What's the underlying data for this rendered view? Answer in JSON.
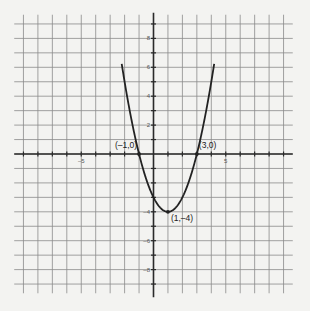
{
  "chart_data": {
    "type": "line",
    "title": "",
    "xlabel": "",
    "ylabel": "",
    "function": "y = (x - 1)^2 - 4",
    "xlim": [
      -9.5,
      9.5
    ],
    "ylim": [
      -9.5,
      9.5
    ],
    "grid": true,
    "x_tick_labels": [
      {
        "value": -5,
        "label": "-5"
      },
      {
        "value": 5,
        "label": "5"
      }
    ],
    "y_tick_labels": [
      {
        "value": 8,
        "label": "8"
      },
      {
        "value": 6,
        "label": "6"
      },
      {
        "value": 4,
        "label": "4"
      },
      {
        "value": 2,
        "label": "2"
      },
      {
        "value": -4,
        "label": "-4"
      },
      {
        "value": -6,
        "label": "-6"
      },
      {
        "value": -8,
        "label": "-8"
      }
    ],
    "series": [
      {
        "name": "parabola",
        "x": [
          -2.1,
          -2,
          -1.5,
          -1,
          -0.5,
          0,
          0.5,
          1,
          1.5,
          2,
          2.5,
          3,
          3.5,
          4,
          4.1
        ],
        "values": [
          5.61,
          5,
          2.25,
          0,
          -1.75,
          -3,
          -3.75,
          -4,
          -3.75,
          -3,
          -1.75,
          0,
          2.25,
          5,
          5.61
        ]
      }
    ],
    "annotations": [
      {
        "x": -1,
        "y": 0,
        "label": "(–1,0)"
      },
      {
        "x": 3,
        "y": 0,
        "label": "(3,0)"
      },
      {
        "x": 1,
        "y": -4,
        "label": "(1,–4)"
      }
    ]
  }
}
